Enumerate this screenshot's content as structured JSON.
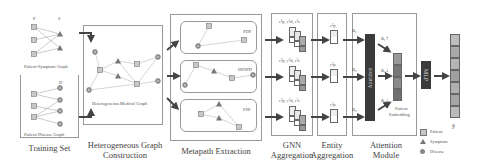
{
  "stages": {
    "training_set": {
      "caption": "Training Set",
      "patient_symptom_graph": {
        "label": "Patient-Symptom Graph",
        "col_p": "P",
        "col_s": "S"
      },
      "patient_disease_graph": {
        "label": "Patient-Disease Graph",
        "col_d": "D"
      }
    },
    "hetero_graph": {
      "caption_line1": "Heterogeneous Graph",
      "caption_line2": "Construction",
      "inner_label": "Heterogeneous Medical Graph"
    },
    "metapath": {
      "caption": "Metapath Extraction",
      "paths": [
        {
          "label": "PDP"
        },
        {
          "label": "DPSPD"
        },
        {
          "label": "PSP"
        }
      ]
    },
    "gnn": {
      "caption_line1": "GNN",
      "caption_line2": "Aggregation",
      "rows": [
        {
          "label": "e¹p, e¹d, e¹s"
        },
        {
          "label": "e²p, e²d, e²s"
        },
        {
          "label": "e³p, e³d, e³s"
        }
      ]
    },
    "entity": {
      "caption_line1": "Entity",
      "caption_line2": "Aggregation",
      "rows": [
        {
          "label": "e¹p"
        },
        {
          "label": "e²p"
        },
        {
          "label": "e³p"
        }
      ]
    },
    "attention": {
      "caption_line1": "Attention",
      "caption_line2": "Module",
      "block_label": "Attention",
      "inputs": [
        {
          "label": "a₁"
        },
        {
          "label": "a₂"
        },
        {
          "label": "a₃"
        }
      ],
      "outputs": [
        {
          "label": "a₁↑"
        },
        {
          "label": "a₂↓"
        },
        {
          "label": "a₃↓"
        }
      ],
      "embedding_label_line1": "Patient",
      "embedding_label_line2": "Embedding"
    },
    "mlp": {
      "label": "MLP"
    },
    "output": {
      "label": "ŷ"
    }
  },
  "legend": [
    {
      "shape": "square",
      "label": "Patient"
    },
    {
      "shape": "triangle",
      "label": "Symptom"
    },
    {
      "shape": "circle",
      "label": "Disease"
    }
  ],
  "colors": {
    "node_fill": "#c8c8c8",
    "node_stroke": "#777777",
    "edge": "#999999",
    "arrow": "#444444",
    "dark_block": "#3a3a3a",
    "box_border": "#9a9a9a"
  }
}
